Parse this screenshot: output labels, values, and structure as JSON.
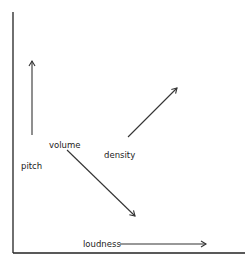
{
  "diagram": {
    "labels": {
      "pitch": "pitch",
      "volume": "volume",
      "density": "density",
      "loudness": "loudness"
    },
    "colors": {
      "background": "#ffffff",
      "ink": "#222222"
    },
    "arrows": [
      {
        "name": "pitch",
        "direction": "up"
      },
      {
        "name": "volume",
        "direction": "down-right"
      },
      {
        "name": "density",
        "direction": "up-right"
      },
      {
        "name": "loudness",
        "direction": "right"
      }
    ]
  }
}
